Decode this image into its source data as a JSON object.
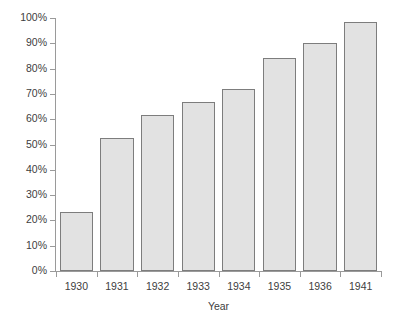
{
  "chart_data": {
    "type": "bar",
    "title": "",
    "subtitle": "",
    "xlabel": "Year",
    "ylabel": "",
    "categories": [
      "1930",
      "1931",
      "1932",
      "1933",
      "1934",
      "1935",
      "1936",
      "1941"
    ],
    "values": [
      23.5,
      52.5,
      61.5,
      67,
      72,
      84,
      90,
      98.5
    ],
    "value_unit": "%",
    "ylim": [
      0,
      100
    ],
    "y_ticks": [
      "0%",
      "10%",
      "20%",
      "30%",
      "40%",
      "50%",
      "60%",
      "70%",
      "80%",
      "90%",
      "100%"
    ],
    "y_tick_values": [
      0,
      10,
      20,
      30,
      40,
      50,
      60,
      70,
      80,
      90,
      100
    ],
    "grid": false,
    "legend": false,
    "legend_position": "none",
    "series": [
      {
        "name": "",
        "values": [
          23.5,
          52.5,
          61.5,
          67,
          72,
          84,
          90,
          98.5
        ]
      }
    ],
    "colors": {
      "bar_fill": "#e2e2e2",
      "bar_border": "#7d7d7d",
      "axis": "#9a9a9a",
      "text": "#404040",
      "background": "#ffffff"
    }
  }
}
